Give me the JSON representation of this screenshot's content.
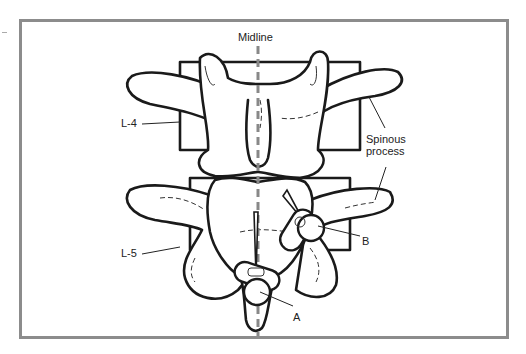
{
  "figure": {
    "labels": {
      "midline": "Midline",
      "l4": "L-4",
      "l5": "L-5",
      "spinous_process": [
        "Spinous",
        "process"
      ],
      "a": "A",
      "b": "B"
    },
    "colors": {
      "frame": "#8c8c8c",
      "outline": "#1a1a1a",
      "midline": "#888888"
    }
  }
}
